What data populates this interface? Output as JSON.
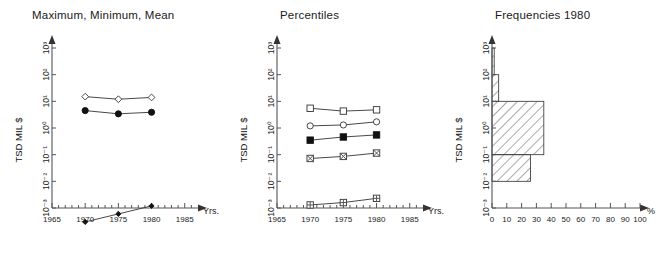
{
  "figure": {
    "y_axis_title": "TSD MIL $",
    "y_ticks": [
      "10³",
      "10²",
      "10¹",
      "10⁰",
      "10⁻¹",
      "10⁻²",
      "10⁻³"
    ],
    "y_exponents": [
      3,
      2,
      1,
      0,
      -1,
      -2,
      -3
    ]
  },
  "chart_data": [
    {
      "type": "line",
      "title": "Maximum, Minimum, Mean",
      "xlabel": "Yrs.",
      "ylabel": "TSD MIL $",
      "yscale": "log",
      "ylim": [
        0.001,
        1000
      ],
      "xlim": [
        1965,
        1987
      ],
      "xticks": [
        1965,
        1970,
        1975,
        1980,
        1985
      ],
      "x": [
        1970,
        1975,
        1980
      ],
      "grid": false,
      "legend": "none",
      "series": [
        {
          "name": "Maximum",
          "marker": "open-diamond",
          "values": [
            15.0,
            12.0,
            14.0
          ]
        },
        {
          "name": "Mean",
          "marker": "filled-circle",
          "values": [
            4.5,
            3.4,
            3.9
          ]
        },
        {
          "name": "Minimum",
          "marker": "small-filled-diamond",
          "values": [
            0.0003,
            0.0006,
            0.0012
          ]
        }
      ]
    },
    {
      "type": "line",
      "title": "Percentiles",
      "xlabel": "Yrs.",
      "ylabel": "TSD MIL $",
      "yscale": "log",
      "ylim": [
        0.001,
        1000
      ],
      "xlim": [
        1965,
        1987
      ],
      "xticks": [
        1965,
        1970,
        1975,
        1980,
        1985
      ],
      "x": [
        1970,
        1975,
        1980
      ],
      "grid": false,
      "legend": "none",
      "series": [
        {
          "name": "95th percentile",
          "marker": "open-square",
          "values": [
            5.5,
            4.3,
            4.8
          ]
        },
        {
          "name": "75th percentile",
          "marker": "open-circle",
          "values": [
            1.2,
            1.3,
            1.7
          ]
        },
        {
          "name": "50th percentile",
          "marker": "filled-square",
          "values": [
            0.35,
            0.46,
            0.55
          ]
        },
        {
          "name": "25th percentile",
          "marker": "crossed-square",
          "values": [
            0.072,
            0.086,
            0.115
          ]
        },
        {
          "name": "5th percentile",
          "marker": "gridded-square",
          "values": [
            0.0013,
            0.0016,
            0.0023
          ]
        }
      ]
    },
    {
      "type": "bar",
      "orientation": "horizontal",
      "title": "Frequencies 1980",
      "xlabel": "%",
      "ylabel": "TSD MIL $",
      "yscale": "log",
      "ylim": [
        0.001,
        1000
      ],
      "xlim": [
        0,
        100
      ],
      "xticks": [
        0,
        10,
        20,
        30,
        40,
        50,
        60,
        70,
        80,
        90,
        100
      ],
      "grid": false,
      "bins": [
        {
          "from": 100,
          "to": 1000,
          "value": 1.5
        },
        {
          "from": 10,
          "to": 100,
          "value": 4.5
        },
        {
          "from": 0.1,
          "to": 10,
          "value": 35.0
        },
        {
          "from": 0.01,
          "to": 0.1,
          "value": 26.0
        },
        {
          "from": 0.001,
          "to": 0.01,
          "value": 0.0
        }
      ]
    }
  ]
}
